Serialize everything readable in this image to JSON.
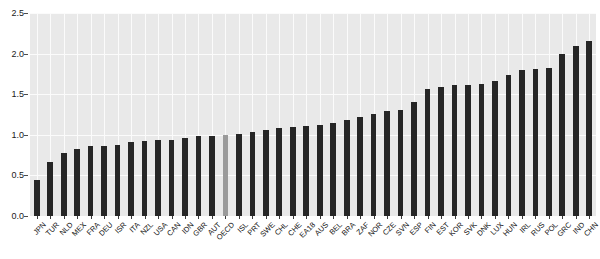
{
  "chart_data": {
    "type": "bar",
    "title": "",
    "subtitle": "",
    "xlabel": "",
    "ylabel": "",
    "ylim": [
      0.0,
      2.5
    ],
    "ytick_labels": [
      "0.0",
      "0.5",
      "1.0",
      "1.5",
      "2.0",
      "2.5"
    ],
    "ytick_values": [
      0.0,
      0.5,
      1.0,
      1.5,
      2.0,
      2.5
    ],
    "grid": true,
    "legend": "none",
    "highlight_category": "OECD",
    "colors": {
      "bar": "#262626",
      "highlight_bar": "#9a9a9a",
      "plot_background": "#e9e9e9",
      "gridline": "#fbfbfb",
      "figure_background": "#ffffff",
      "text": "#1a1a1a"
    },
    "categories": [
      "JPN",
      "TUR",
      "NLD",
      "MEX",
      "FRA",
      "DEU",
      "ISR",
      "ITA",
      "NZL",
      "USA",
      "CAN",
      "IDN",
      "GBR",
      "AUT",
      "OECD",
      "ISL",
      "PRT",
      "SWE",
      "CHL",
      "CHE",
      "EA18",
      "AUS",
      "BEL",
      "BRA",
      "ZAF",
      "NOR",
      "CZE",
      "SVN",
      "ESP",
      "FIN",
      "EST",
      "KOR",
      "SVK",
      "DNK",
      "LUX",
      "HUN",
      "IRL",
      "RUS",
      "POL",
      "GRC",
      "IND",
      "CHN"
    ],
    "values": [
      0.44,
      0.67,
      0.78,
      0.82,
      0.86,
      0.86,
      0.88,
      0.91,
      0.92,
      0.93,
      0.94,
      0.96,
      0.98,
      0.99,
      1.0,
      1.01,
      1.03,
      1.06,
      1.08,
      1.1,
      1.11,
      1.12,
      1.14,
      1.18,
      1.22,
      1.26,
      1.29,
      1.3,
      1.4,
      1.57,
      1.59,
      1.61,
      1.61,
      1.62,
      1.66,
      1.74,
      1.8,
      1.81,
      1.82,
      1.99,
      2.09,
      2.15
    ]
  }
}
